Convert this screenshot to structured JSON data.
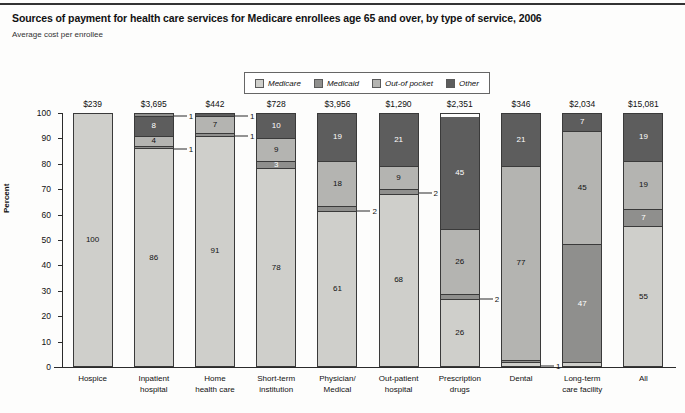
{
  "header": {
    "title": "Sources of payment for health care services for Medicare enrollees age 65 and over, by type of service, 2006",
    "subtitle": "Average cost per enrollee"
  },
  "legend": {
    "items": [
      {
        "label": "Medicare",
        "color": "#cfcfcb"
      },
      {
        "label": "Medicaid",
        "color": "#8f8f8d"
      },
      {
        "label": "Out-of pocket",
        "color": "#b4b4b1"
      },
      {
        "label": "Other",
        "color": "#5d5d5d"
      }
    ]
  },
  "axes": {
    "ylabel": "Percent",
    "yticks": [
      "0",
      "10",
      "20",
      "30",
      "40",
      "50",
      "60",
      "70",
      "80",
      "90",
      "100"
    ]
  },
  "chart_data": {
    "type": "bar",
    "title": "Sources of payment for health care services for Medicare enrollees age 65 and over, by type of service, 2006",
    "subtitle": "Average cost per enrollee",
    "stacked": true,
    "xlabel": "",
    "ylabel": "Percent",
    "ylim": [
      0,
      100
    ],
    "grid": false,
    "legend_position": "top-center",
    "categories": [
      "Hospice",
      "Inpatient hospital",
      "Home health care",
      "Short-term institution",
      "Physician/ Medical",
      "Out-patient hospital",
      "Prescription drugs",
      "Dental",
      "Long-term care facility",
      "All"
    ],
    "category_lines": [
      [
        "Hospice"
      ],
      [
        "Inpatient",
        "hospital"
      ],
      [
        "Home",
        "health care"
      ],
      [
        "Short-term",
        "institution"
      ],
      [
        "Physician/",
        "Medical"
      ],
      [
        "Out-patient",
        "hospital"
      ],
      [
        "Prescription",
        "drugs"
      ],
      [
        "Dental"
      ],
      [
        "Long-term",
        "care facility"
      ],
      [
        "All"
      ]
    ],
    "bar_value_labels": [
      "$239",
      "$3,695",
      "$442",
      "$728",
      "$3,956",
      "$1,290",
      "$2,351",
      "$346",
      "$2,034",
      "$15,081"
    ],
    "series": [
      {
        "name": "Medicare",
        "values": [
          100,
          86,
          91,
          78,
          61,
          68,
          26,
          1,
          1,
          55
        ]
      },
      {
        "name": "Medicaid",
        "values": [
          0,
          1,
          1,
          3,
          2,
          2,
          2,
          1,
          47,
          7
        ]
      },
      {
        "name": "Out-of pocket",
        "values": [
          0,
          4,
          7,
          9,
          18,
          9,
          26,
          77,
          45,
          19
        ]
      },
      {
        "name": "Other",
        "values": [
          0,
          8,
          1,
          10,
          19,
          21,
          45,
          21,
          7,
          19
        ]
      }
    ],
    "bars": [
      {
        "category": "Hospice",
        "value_label": "$239",
        "segments": [
          {
            "series": "Medicare",
            "value": 100,
            "label": "100",
            "label_shown": true,
            "callout": false
          }
        ]
      },
      {
        "category": "Inpatient hospital",
        "value_label": "$3,695",
        "segments": [
          {
            "series": "Medicare",
            "value": 86,
            "label": "86",
            "label_shown": true,
            "callout": false
          },
          {
            "series": "Medicaid",
            "value": 1,
            "label": "1",
            "label_shown": false,
            "callout": true
          },
          {
            "series": "Out-of pocket",
            "value": 4,
            "label": "4",
            "label_shown": true,
            "callout": false
          },
          {
            "series": "Other",
            "value": 8,
            "label": "8",
            "label_shown": true,
            "callout": false
          },
          {
            "series": "Medicaid",
            "value": 1,
            "label": "1",
            "label_shown": false,
            "callout": true
          }
        ]
      },
      {
        "category": "Home health care",
        "value_label": "$442",
        "segments": [
          {
            "series": "Medicare",
            "value": 91,
            "label": "91",
            "label_shown": true,
            "callout": false
          },
          {
            "series": "Medicaid",
            "value": 1,
            "label": "1",
            "label_shown": false,
            "callout": true
          },
          {
            "series": "Out-of pocket",
            "value": 7,
            "label": "7",
            "label_shown": true,
            "callout": false
          },
          {
            "series": "Other",
            "value": 1,
            "label": "1",
            "label_shown": false,
            "callout": true
          }
        ]
      },
      {
        "category": "Short-term institution",
        "value_label": "$728",
        "segments": [
          {
            "series": "Medicare",
            "value": 78,
            "label": "78",
            "label_shown": true,
            "callout": false
          },
          {
            "series": "Medicaid",
            "value": 3,
            "label": "3",
            "label_shown": true,
            "callout": false
          },
          {
            "series": "Out-of pocket",
            "value": 9,
            "label": "9",
            "label_shown": true,
            "callout": false
          },
          {
            "series": "Other",
            "value": 10,
            "label": "10",
            "label_shown": true,
            "callout": false
          }
        ]
      },
      {
        "category": "Physician/ Medical",
        "value_label": "$3,956",
        "segments": [
          {
            "series": "Medicare",
            "value": 61,
            "label": "61",
            "label_shown": true,
            "callout": false
          },
          {
            "series": "Medicaid",
            "value": 2,
            "label": "2",
            "label_shown": false,
            "callout": true
          },
          {
            "series": "Out-of pocket",
            "value": 18,
            "label": "18",
            "label_shown": true,
            "callout": false
          },
          {
            "series": "Other",
            "value": 19,
            "label": "19",
            "label_shown": true,
            "callout": false
          }
        ]
      },
      {
        "category": "Out-patient hospital",
        "value_label": "$1,290",
        "segments": [
          {
            "series": "Medicare",
            "value": 68,
            "label": "68",
            "label_shown": true,
            "callout": false
          },
          {
            "series": "Medicaid",
            "value": 2,
            "label": "2",
            "label_shown": false,
            "callout": true
          },
          {
            "series": "Out-of pocket",
            "value": 9,
            "label": "9",
            "label_shown": true,
            "callout": false
          },
          {
            "series": "Other",
            "value": 21,
            "label": "21",
            "label_shown": true,
            "callout": false
          }
        ]
      },
      {
        "category": "Prescription drugs",
        "value_label": "$2,351",
        "segments": [
          {
            "series": "Medicare",
            "value": 26,
            "label": "26",
            "label_shown": true,
            "callout": false
          },
          {
            "series": "Medicaid",
            "value": 2,
            "label": "2",
            "label_shown": false,
            "callout": true
          },
          {
            "series": "Out-of pocket",
            "value": 26,
            "label": "26",
            "label_shown": true,
            "callout": false
          },
          {
            "series": "Other",
            "value": 45,
            "label": "45",
            "label_shown": true,
            "callout": false
          }
        ]
      },
      {
        "category": "Dental",
        "value_label": "$346",
        "segments": [
          {
            "series": "Medicare",
            "value": 1,
            "label": "1",
            "label_shown": false,
            "callout": true
          },
          {
            "series": "Medicaid",
            "value": 1,
            "label": "1",
            "label_shown": false,
            "callout": false
          },
          {
            "series": "Out-of pocket",
            "value": 77,
            "label": "77",
            "label_shown": true,
            "callout": false
          },
          {
            "series": "Other",
            "value": 21,
            "label": "21",
            "label_shown": true,
            "callout": false
          }
        ]
      },
      {
        "category": "Long-term care facility",
        "value_label": "$2,034",
        "segments": [
          {
            "series": "Medicare",
            "value": 1,
            "label": "1",
            "label_shown": false,
            "callout": false
          },
          {
            "series": "Medicaid",
            "value": 47,
            "label": "47",
            "label_shown": true,
            "callout": false
          },
          {
            "series": "Out-of pocket",
            "value": 45,
            "label": "45",
            "label_shown": true,
            "callout": false
          },
          {
            "series": "Other",
            "value": 7,
            "label": "7",
            "label_shown": true,
            "callout": false
          }
        ]
      },
      {
        "category": "All",
        "value_label": "$15,081",
        "segments": [
          {
            "series": "Medicare",
            "value": 55,
            "label": "55",
            "label_shown": true,
            "callout": false
          },
          {
            "series": "Medicaid",
            "value": 7,
            "label": "7",
            "label_shown": true,
            "callout": false
          },
          {
            "series": "Out-of pocket",
            "value": 19,
            "label": "19",
            "label_shown": true,
            "callout": false
          },
          {
            "series": "Other",
            "value": 19,
            "label": "19",
            "label_shown": true,
            "callout": false
          }
        ]
      }
    ]
  }
}
